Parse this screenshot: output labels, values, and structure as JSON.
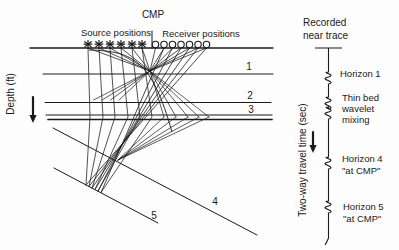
{
  "figure": {
    "type": "seismic CMP ray-path diagram with recorded near trace",
    "background": "#fdfdfd",
    "ink_color": "#1a1a1a"
  },
  "texts": [
    {
      "name": "cmp-label",
      "text": "CMP",
      "x": 153,
      "y": 18,
      "anchor": "middle",
      "size": 10
    },
    {
      "name": "source-positions-label",
      "text": "Source positions",
      "x": 116,
      "y": 36,
      "anchor": "middle",
      "size": 9.5
    },
    {
      "name": "receiver-positions-label",
      "text": "Receiver positions",
      "x": 201,
      "y": 37,
      "anchor": "middle",
      "size": 9.5
    },
    {
      "name": "depth-axis-label",
      "text": "Depth (ft)",
      "x": 14,
      "y": 94,
      "anchor": "middle",
      "size": 10,
      "rotate": -90
    },
    {
      "name": "time-axis-label",
      "text": "Two-way travel time (sec)",
      "x": 306,
      "y": 160,
      "anchor": "middle",
      "size": 10,
      "rotate": -90
    },
    {
      "name": "recorded-title-line1",
      "text": "Recorded",
      "x": 303,
      "y": 26,
      "anchor": "start",
      "size": 10
    },
    {
      "name": "recorded-title-line2",
      "text": "near trace",
      "x": 303,
      "y": 39,
      "anchor": "start",
      "size": 10
    },
    {
      "name": "horizon-1-number",
      "text": "1",
      "x": 249,
      "y": 70,
      "anchor": "middle",
      "size": 10
    },
    {
      "name": "horizon-2-number",
      "text": "2",
      "x": 250,
      "y": 99,
      "anchor": "middle",
      "size": 10
    },
    {
      "name": "horizon-3-number",
      "text": "3",
      "x": 251,
      "y": 113,
      "anchor": "middle",
      "size": 10
    },
    {
      "name": "horizon-4-number",
      "text": "4",
      "x": 215,
      "y": 205,
      "anchor": "middle",
      "size": 10
    },
    {
      "name": "horizon-5-number",
      "text": "5",
      "x": 154,
      "y": 219,
      "anchor": "middle",
      "size": 10
    },
    {
      "name": "trace-note-horizon-1",
      "text": "Horizon 1",
      "x": 340,
      "y": 77,
      "anchor": "start",
      "size": 9.5
    },
    {
      "name": "trace-note-thin-bed",
      "text": "Thin bed",
      "x": 342,
      "y": 101,
      "anchor": "start",
      "size": 9.5
    },
    {
      "name": "trace-note-wavelet",
      "text": "wavelet",
      "x": 342,
      "y": 112,
      "anchor": "start",
      "size": 9.5
    },
    {
      "name": "trace-note-mixing",
      "text": "mixing",
      "x": 342,
      "y": 123,
      "anchor": "start",
      "size": 9.5
    },
    {
      "name": "trace-note-horizon-4",
      "text": "Horizon 4",
      "x": 342,
      "y": 162,
      "anchor": "start",
      "size": 9.5
    },
    {
      "name": "trace-note-horizon-4-at-cmp",
      "text": "\"at CMP\"",
      "x": 342,
      "y": 174,
      "anchor": "start",
      "size": 9.5
    },
    {
      "name": "trace-note-horizon-5",
      "text": "Horizon 5",
      "x": 343,
      "y": 210,
      "anchor": "start",
      "size": 9.5
    },
    {
      "name": "trace-note-horizon-5-at-cmp",
      "text": "\"at CMP\"",
      "x": 343,
      "y": 222,
      "anchor": "start",
      "size": 9.5
    }
  ],
  "diagram": {
    "surface": {
      "x1": 30,
      "x2": 273,
      "y": 48
    },
    "flat_horizons": [
      {
        "id": "horizon-1",
        "x1": 43,
        "x2": 273,
        "y": 74,
        "w": 1.1
      },
      {
        "id": "horizon-2",
        "x1": 45,
        "x2": 271,
        "y": 102.5,
        "w": 1.1
      },
      {
        "id": "horizon-3a",
        "x1": 46,
        "x2": 272,
        "y": 115,
        "w": 1.1
      },
      {
        "id": "horizon-3b",
        "x1": 48,
        "x2": 272,
        "y": 119.5,
        "w": 1.7
      }
    ],
    "dipping_horizons": [
      {
        "id": "horizon-4",
        "x1": 53,
        "y1": 128,
        "x2": 257,
        "y2": 235
      },
      {
        "id": "horizon-5",
        "x1": 54,
        "y1": 168,
        "x2": 158,
        "y2": 223
      }
    ],
    "cmp_tick": {
      "x": 152,
      "y1": 31,
      "y2": 48
    },
    "marker_y": 44.5,
    "sources": [
      88,
      99,
      110,
      121,
      132,
      142
    ],
    "receivers": [
      155.5,
      164,
      172.5,
      181,
      189.5,
      198,
      206.5
    ],
    "apex": [
      150,
      71
    ],
    "apex_extensions": [
      [
        119,
        100
      ],
      [
        110.5,
        100
      ],
      [
        102,
        100
      ],
      [
        93.5,
        100
      ]
    ],
    "bend_xs": [
      90,
      103,
      115,
      128,
      140,
      152
    ],
    "bend_y": 117,
    "deep_points": [
      [
        86,
        185
      ],
      [
        89,
        186.5
      ],
      [
        92,
        188
      ],
      [
        95,
        189.5
      ],
      [
        98,
        191
      ],
      [
        101,
        192.5
      ]
    ],
    "apex_fan_xs": [
      164,
      176,
      188,
      199,
      209
    ],
    "apex_fan_y": 117,
    "waist": [
      118,
      160
    ],
    "arc_path": "M89,50 C135,51 152,62 172,132",
    "depth_arrow": {
      "x": 33,
      "y1": 97,
      "y2": 116,
      "tip": 123
    },
    "time_arrow": {
      "x": 313,
      "y1": 132,
      "y2": 146,
      "tip": 153
    }
  },
  "trace": {
    "x": 328.5,
    "top_bar": {
      "x1": 315,
      "x2": 342,
      "y": 48
    },
    "bottom_y": 238,
    "wavelets_y": [
      78,
      103,
      113,
      163,
      207
    ]
  }
}
